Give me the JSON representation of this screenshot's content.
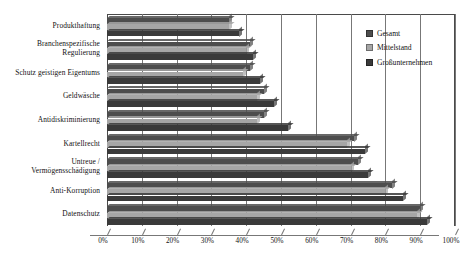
{
  "chart_data": {
    "type": "bar",
    "orientation": "horizontal",
    "title": "",
    "xlabel": "",
    "ylabel": "",
    "xlim": [
      0,
      100
    ],
    "xticks": [
      "0%",
      "10%",
      "20%",
      "30%",
      "40%",
      "50%",
      "60%",
      "70%",
      "80%",
      "90%",
      "100%"
    ],
    "grid": true,
    "legend_position": "top-right",
    "categories": [
      "Produkthaftung",
      "Branchenspezifische\nRegulierung",
      "Schutz geistigen Eigentums",
      "Geldwäsche",
      "Antidiskriminierung",
      "Kartellrecht",
      "Untreue /\nVermögensschädigung",
      "Anti-Korruption",
      "Datenschutz"
    ],
    "series": [
      {
        "name": "Gesamt",
        "color": "#4d4d4d",
        "values": [
          35,
          41,
          41,
          45,
          45,
          71,
          72,
          82,
          90
        ]
      },
      {
        "name": "Mittelstand",
        "color": "#a6a6a6",
        "values": [
          35,
          40,
          39,
          43,
          43,
          69,
          70,
          80,
          89
        ]
      },
      {
        "name": "Großunternehmen",
        "color": "#3a3a3a",
        "values": [
          38,
          42,
          44,
          48,
          52,
          74,
          75,
          85,
          92
        ]
      }
    ]
  },
  "legend": {
    "items": [
      {
        "label": "Gesamt",
        "color": "#4d4d4d"
      },
      {
        "label": "Mittelstand",
        "color": "#a6a6a6"
      },
      {
        "label": "Großunternehmen",
        "color": "#3a3a3a"
      }
    ]
  }
}
